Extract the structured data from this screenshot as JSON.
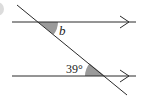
{
  "diagram": {
    "type": "parallel-lines-transversal",
    "lines": {
      "top": {
        "y": 22,
        "x1": 12,
        "x2": 136,
        "arrow_x": 128
      },
      "bottom": {
        "y": 76,
        "x1": 12,
        "x2": 136,
        "arrow_x": 128
      }
    },
    "transversal": {
      "x1": 17,
      "y1": 5,
      "x2": 127,
      "y2": 95
    },
    "angles": [
      {
        "id": "b",
        "label": "b",
        "vertex": [
          38,
          22
        ],
        "shaded": true
      },
      {
        "id": "given",
        "label": "39°",
        "vertex": [
          105,
          76
        ],
        "shaded": true
      }
    ],
    "colors": {
      "line": "#2a2a2a",
      "shade": "#9a9a9a",
      "background": "#ffffff",
      "edge_mark": "#d8d8d8"
    }
  }
}
